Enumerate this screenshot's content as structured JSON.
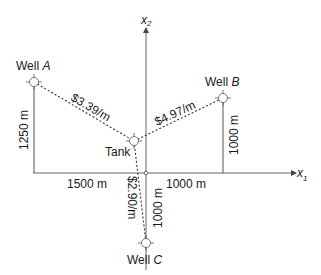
{
  "axes": {
    "x1_label": "x",
    "x1_sub": "1",
    "x2_label": "x",
    "x2_sub": "2"
  },
  "wells": {
    "a": {
      "label": "Well ",
      "letter": "A"
    },
    "b": {
      "label": "Well ",
      "letter": "B"
    },
    "c": {
      "label": "Well ",
      "letter": "C"
    }
  },
  "tank": {
    "label": "Tank"
  },
  "costs": {
    "a": "$3.39/m",
    "b": "$4.97/m",
    "c": "$2.90/m"
  },
  "dimensions": {
    "a_height": "1250 m",
    "b_height": "1000 m",
    "c_depth": "1000 m",
    "left_width": "1500 m",
    "right_width": "1000 m"
  },
  "colors": {
    "line": "#444444",
    "text": "#1a1a1a"
  }
}
